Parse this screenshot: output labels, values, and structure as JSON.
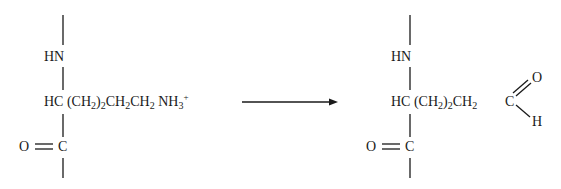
{
  "reactant": {
    "top_group": "HN",
    "alpha_carbon": "HC",
    "side_chain": [
      {
        "text": "(CH",
        "sub": "2"
      },
      {
        "text": ")",
        "sub": "2"
      },
      {
        "text": "CH",
        "sub": "2"
      },
      {
        "text": "CH",
        "sub": "2"
      },
      {
        "text": "NH",
        "sub": "3",
        "sup": "+"
      }
    ],
    "carbonyl_o": "O",
    "carbonyl_c": "C"
  },
  "product": {
    "top_group": "HN",
    "alpha_carbon": "HC",
    "side_chain": [
      {
        "text": "(CH",
        "sub": "2"
      },
      {
        "text": ")",
        "sub": "2"
      },
      {
        "text": "CH",
        "sub": "2"
      }
    ],
    "aldehyde_c": "C",
    "aldehyde_o": "O",
    "aldehyde_h": "H",
    "carbonyl_o": "O",
    "carbonyl_c": "C"
  },
  "arrow": {
    "direction": "right"
  }
}
